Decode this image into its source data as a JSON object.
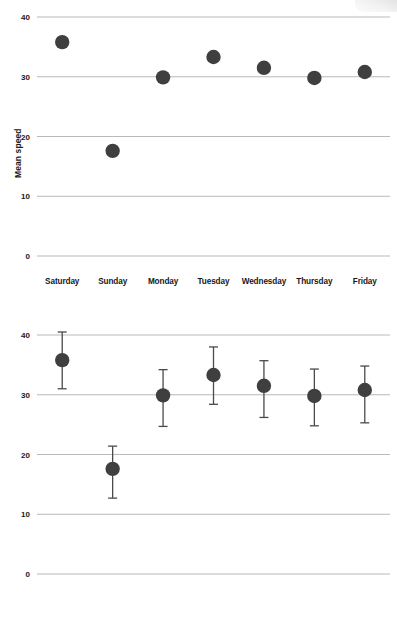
{
  "figure": {
    "background": "#ffffff",
    "marker_color": "#3f3f3f",
    "gridline_color": "#b9b9b9",
    "errorbar_color": "#4a4a4a",
    "text_color": "#181818"
  },
  "chart_data": [
    {
      "id": "panel-top",
      "type": "scatter",
      "title": "",
      "xlabel": "",
      "ylabel": "Mean speed",
      "categories": [
        "Saturday",
        "Sunday",
        "Monday",
        "Tuesday",
        "Wednesday",
        "Thursday",
        "Friday"
      ],
      "values": [
        35.8,
        17.6,
        29.9,
        33.3,
        31.5,
        29.8,
        30.8
      ],
      "errors": null,
      "yticks": [
        0,
        10,
        20,
        30,
        40
      ],
      "ytick_labels": [
        "0",
        "10",
        "20",
        "30",
        "40"
      ],
      "ylim": [
        0,
        41.5
      ],
      "grid": "horizontal",
      "legend": "none"
    },
    {
      "id": "panel-bottom",
      "type": "scatter",
      "title": "",
      "xlabel": "",
      "ylabel": "Mean speed",
      "categories": [
        "Saturday",
        "Sunday",
        "Monday",
        "Tuesday",
        "Wednesday",
        "Thursday",
        "Friday"
      ],
      "values": [
        35.8,
        17.6,
        29.9,
        33.3,
        31.5,
        29.8,
        30.8
      ],
      "errors": [
        {
          "category": "Saturday",
          "low": 31.0,
          "high": 40.5
        },
        {
          "category": "Sunday",
          "low": 12.7,
          "high": 21.4
        },
        {
          "category": "Monday",
          "low": 24.7,
          "high": 34.2
        },
        {
          "category": "Tuesday",
          "low": 28.4,
          "high": 38.0
        },
        {
          "category": "Wednesday",
          "low": 26.2,
          "high": 35.7
        },
        {
          "category": "Thursday",
          "low": 24.8,
          "high": 34.3
        },
        {
          "category": "Friday",
          "low": 25.3,
          "high": 34.8
        }
      ],
      "yticks": [
        0,
        10,
        20,
        30,
        40
      ],
      "ytick_labels": [
        "0",
        "10",
        "20",
        "30",
        "40"
      ],
      "ylim": [
        0,
        41.5
      ],
      "grid": "horizontal",
      "legend": "none"
    }
  ]
}
